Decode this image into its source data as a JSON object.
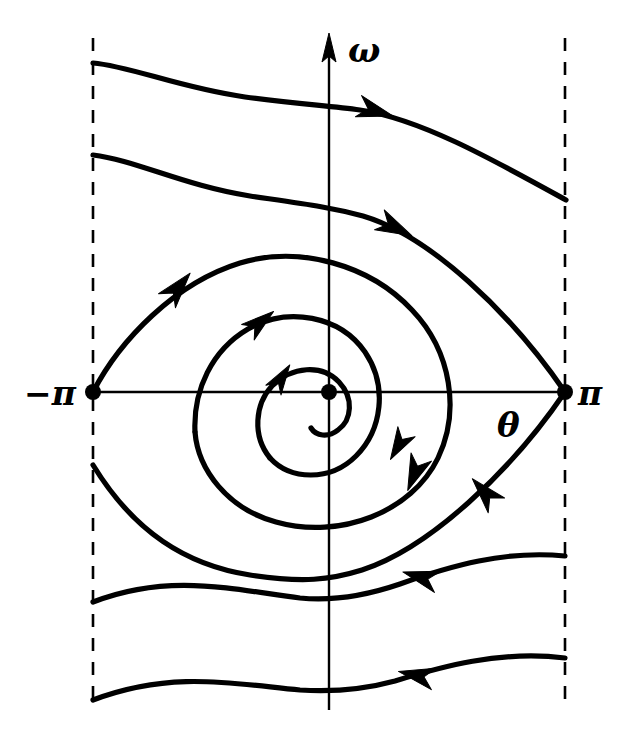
{
  "figure": {
    "kind": "phase-portrait",
    "background_color": "#ffffff",
    "ink_color": "#000000",
    "width": 629,
    "height": 753
  },
  "axes": {
    "vertical": {
      "label": "ω",
      "name": "omega-axis",
      "label_x": 348,
      "label_y": 62,
      "x": 329,
      "y_top": 38,
      "y_bottom": 710,
      "arrow_tip_y": 38
    },
    "horizontal": {
      "label": "θ",
      "name": "theta-axis",
      "label_x": 497,
      "label_y": 437,
      "y": 392,
      "x_left": 93,
      "x_right": 565
    },
    "origin": {
      "x": 329,
      "y": 392,
      "dot_radius": 8
    }
  },
  "ticks": [
    {
      "label": "−π",
      "name": "tick-minus-pi",
      "x": 24,
      "y": 405,
      "value": -3.14159
    },
    {
      "label": "π",
      "name": "tick-plus-pi",
      "x": 578,
      "y": 405,
      "value": 3.14159
    }
  ],
  "fixed_points": [
    {
      "name": "saddle-left",
      "type": "saddle",
      "x": 93,
      "y": 392,
      "theta": -3.14159,
      "omega": 0
    },
    {
      "name": "spiral-origin",
      "type": "stable-spiral",
      "x": 329,
      "y": 392,
      "theta": 0,
      "omega": 0
    },
    {
      "name": "saddle-right",
      "type": "saddle",
      "x": 565,
      "y": 392,
      "theta": 3.14159,
      "omega": 0
    }
  ],
  "boundaries": [
    {
      "name": "boundary-left-dashed",
      "x": 93,
      "y_top": 38,
      "y_bottom": 710
    },
    {
      "name": "boundary-right-dashed",
      "x": 565,
      "y_top": 38,
      "y_bottom": 710
    }
  ],
  "trajectories": [
    {
      "name": "trajectory-rotating-top-outer",
      "direction": "rightward",
      "path": "M 93 63 C 130 66 180 88 245 97 C 300 104 330 106 360 110 C 420 119 490 158 566 200"
    },
    {
      "name": "trajectory-incoming-separatrix-upper",
      "direction": "rightward",
      "path": "M 93 155 C 135 160 185 186 250 196 C 305 204 330 207 363 216 C 430 236 510 312 565 392"
    },
    {
      "name": "trajectory-outer-spiral-eye",
      "direction": "counterclockwise-inward",
      "path": "M 93 392 C 120 340 175 283 240 263 C 300 245 370 265 412 310 C 452 352 460 412 438 458 C 412 512 340 540 276 522 C 228 509 198 470 195 432"
    },
    {
      "name": "trajectory-inner-spiral-second-turn",
      "direction": "counterclockwise-inward",
      "path": "M 195 432 C 193 390 212 350 248 329 C 288 306 340 316 365 352 C 388 386 382 430 356 456 C 330 482 290 480 270 458"
    },
    {
      "name": "trajectory-inner-spiral-third-turn",
      "direction": "counterclockwise-inward",
      "path": "M 270 458 C 252 436 255 404 272 386 C 292 366 322 364 339 382 C 354 398 352 420 338 430 C 328 438 316 436 311 428"
    },
    {
      "name": "trajectory-outgoing-separatrix-lower",
      "direction": "leftward-into-left-saddle",
      "path": "M 565 392 C 512 470 430 548 362 570 C 330 580 303 583 250 575 C 186 565 134 532 93 465"
    },
    {
      "name": "trajectory-rotating-bottom-inner",
      "direction": "leftward",
      "path": "M 565 556 C 505 550 450 566 400 584 C 362 597 330 601 300 598 C 235 590 170 572 93 602"
    },
    {
      "name": "trajectory-rotating-bottom-outer",
      "direction": "leftward",
      "path": "M 565 658 C 500 650 440 667 395 681 C 362 690 332 692 300 690 C 235 684 172 670 93 700"
    }
  ],
  "flow_arrows": [
    {
      "name": "arrow-top-rightward",
      "x": 372,
      "y": 110,
      "angle": 16
    },
    {
      "name": "arrow-upper-separatrix-rightward",
      "x": 392,
      "y": 226,
      "angle": 26
    },
    {
      "name": "arrow-outer-spiral-up-right",
      "x": 176,
      "y": 290,
      "angle": -50
    },
    {
      "name": "arrow-mid-spiral-up-right",
      "x": 258,
      "y": 324,
      "angle": -39
    },
    {
      "name": "arrow-inner-spiral-up-right",
      "x": 280,
      "y": 380,
      "angle": -57
    },
    {
      "name": "arrow-outer-spiral-down-right",
      "x": 416,
      "y": 470,
      "angle": 112
    },
    {
      "name": "arrow-mid-spiral-down-right",
      "x": 400,
      "y": 443,
      "angle": 120
    },
    {
      "name": "arrow-lower-separatrix-leftward",
      "x": 487,
      "y": 495,
      "angle": 228
    },
    {
      "name": "arrow-bottom-inner-leftward",
      "x": 424,
      "y": 578,
      "angle": 196
    },
    {
      "name": "arrow-bottom-outer-leftward",
      "x": 420,
      "y": 676,
      "angle": 192
    }
  ]
}
